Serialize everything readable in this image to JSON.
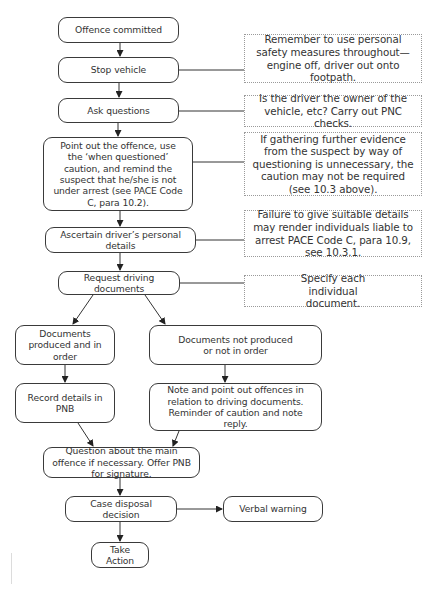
{
  "flowchart": {
    "steps": [
      {
        "id": "offence-committed",
        "label": "Offence committed"
      },
      {
        "id": "stop-vehicle",
        "label": "Stop vehicle"
      },
      {
        "id": "ask-questions",
        "label": "Ask questions"
      },
      {
        "id": "point-out-offence",
        "label": "Point out the offence, use the ‘when questioned’ caution, and remind the suspect that he/she is not under arrest (see PACE Code C, para 10.2)."
      },
      {
        "id": "ascertain-details",
        "label": "Ascertain driver’s personal details"
      },
      {
        "id": "request-documents",
        "label": "Request driving documents"
      },
      {
        "id": "documents-produced",
        "label": "Documents produced and in order"
      },
      {
        "id": "documents-not-produced",
        "label": "Documents not produced or not in order"
      },
      {
        "id": "record-details",
        "label": "Record details in PNB"
      },
      {
        "id": "note-offences",
        "label": "Note and point out offences in relation to driving documents. Reminder of caution and note reply."
      },
      {
        "id": "question-main-offence",
        "label": "Question about the main offence if necessary. Offer PNB for signature."
      },
      {
        "id": "case-disposal",
        "label": "Case disposal decision"
      },
      {
        "id": "verbal-warning",
        "label": "Verbal warning"
      },
      {
        "id": "take-action",
        "label": "Take Action"
      }
    ],
    "notes": [
      {
        "attached_to": "stop-vehicle",
        "text": "Remember to use personal safety measures throughout—engine off, driver out onto footpath."
      },
      {
        "attached_to": "ask-questions",
        "text": "Is the driver the owner of the vehicle, etc? Carry out PNC checks."
      },
      {
        "attached_to": "point-out-offence",
        "text": "If gathering further evidence from the suspect by way of questioning is unnecessary, the caution may not be required (see 10.3 above)."
      },
      {
        "attached_to": "ascertain-details",
        "text": "Failure to give suitable details may render individuals liable to arrest PACE Code C, para 10.9, see 10.3.1."
      },
      {
        "attached_to": "request-documents",
        "text": "Specify each individual document."
      }
    ],
    "edges": [
      [
        "offence-committed",
        "stop-vehicle"
      ],
      [
        "stop-vehicle",
        "ask-questions"
      ],
      [
        "ask-questions",
        "point-out-offence"
      ],
      [
        "point-out-offence",
        "ascertain-details"
      ],
      [
        "ascertain-details",
        "request-documents"
      ],
      [
        "request-documents",
        "documents-produced"
      ],
      [
        "request-documents",
        "documents-not-produced"
      ],
      [
        "documents-produced",
        "record-details"
      ],
      [
        "documents-not-produced",
        "note-offences"
      ],
      [
        "record-details",
        "question-main-offence"
      ],
      [
        "note-offences",
        "question-main-offence"
      ],
      [
        "question-main-offence",
        "case-disposal"
      ],
      [
        "case-disposal",
        "verbal-warning"
      ],
      [
        "case-disposal",
        "take-action"
      ]
    ],
    "colors": {
      "stroke": "#3a3a3a",
      "note_border": "#9a9a9a",
      "background": "#ffffff"
    }
  }
}
